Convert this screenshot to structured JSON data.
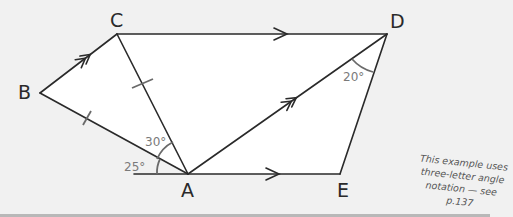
{
  "diagram": {
    "type": "geometry-figure",
    "vertices": [
      {
        "label": "A",
        "x": 188,
        "y": 174
      },
      {
        "label": "B",
        "x": 40,
        "y": 93
      },
      {
        "label": "C",
        "x": 117,
        "y": 34
      },
      {
        "label": "D",
        "x": 387,
        "y": 34
      },
      {
        "label": "E",
        "x": 340,
        "y": 174
      }
    ],
    "segments": [
      "BC",
      "CD",
      "DE",
      "EA",
      "AB",
      "AC",
      "AD",
      "A-left-ray"
    ],
    "parallel_marks": {
      "single_arrow": [
        "CD",
        "AE"
      ],
      "double_arrow": [
        "BC",
        "AD"
      ]
    },
    "equal_length_marks": [
      "AB",
      "AC"
    ],
    "angles": [
      {
        "label": "25°",
        "at": "A",
        "between": "ray-left and AB"
      },
      {
        "label": "30°",
        "at": "A",
        "between": "AB and AC"
      },
      {
        "label": "20°",
        "at": "D",
        "between": "DA and DE"
      }
    ],
    "labels": {
      "A": "A",
      "B": "B",
      "C": "C",
      "D": "D",
      "E": "E",
      "angle_25": "25°",
      "angle_30": "30°",
      "angle_20": "20°"
    },
    "note": {
      "line1": "This example uses",
      "line2": "three-letter angle",
      "line3": "notation — see p.137"
    },
    "colors": {
      "background": "#f1f1f1",
      "fill": "#ffffff",
      "stroke": "#2a2a2a",
      "annotation": "#7a7a7a"
    }
  }
}
